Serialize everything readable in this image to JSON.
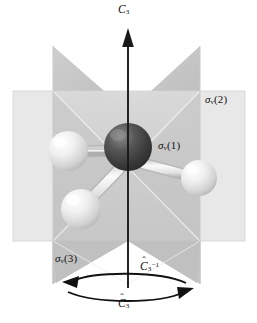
{
  "figure": {
    "name": "ammonia-c3v-symmetry-diagram",
    "caption_absent": true,
    "background_color": "#ffffff"
  },
  "labels": {
    "axis": {
      "symbol": "C",
      "subscript": "3",
      "text": "C3",
      "name": "c3-axis-label"
    },
    "mirror_planes": [
      {
        "id": "sv1",
        "symbol": "σ",
        "subscript": "v",
        "paren": "(1)",
        "text": "σv(1)"
      },
      {
        "id": "sv2",
        "symbol": "σ",
        "subscript": "v",
        "paren": "(2)",
        "text": "σv(2)"
      },
      {
        "id": "sv3",
        "symbol": "σ",
        "subscript": "v",
        "paren": "(3)",
        "text": "σv(3)"
      }
    ],
    "rotations": [
      {
        "id": "c3-inverse",
        "symbol": "C",
        "subscript": "3",
        "superscript": "−1",
        "hat": "ˆ",
        "text": "Ĉ₃⁻¹"
      },
      {
        "id": "c3-forward",
        "symbol": "C",
        "subscript": "3",
        "superscript": "",
        "hat": "ˆ",
        "text": "Ĉ₃"
      }
    ]
  },
  "colors": {
    "plane_light": "#e7e7e7",
    "plane_mid": "#cfcfcf",
    "plane_dark": "#bdbdbd",
    "plane_edge": "#f3f3f3",
    "axis_line": "#1a1a1a",
    "central_atom_dark": "#3b3b3b",
    "central_atom_light": "#6e6e6e",
    "outer_atom_light": "#f2f2f2",
    "outer_atom_mid": "#c9c9c9",
    "bond": "#ededed",
    "bond_shade": "#b9b9b9",
    "text": "#111111"
  },
  "geometry": {
    "axis_x": 128,
    "axis_top_y": 28,
    "axis_bottom_y": 288,
    "central_atom": {
      "cx": 128,
      "cy": 147,
      "r": 24
    },
    "outer_atoms": [
      {
        "id": "h-left",
        "cx": 68,
        "cy": 151,
        "r": 20
      },
      {
        "id": "h-right",
        "cx": 199,
        "cy": 178,
        "r": 18
      },
      {
        "id": "h-lower-left",
        "cx": 81,
        "cy": 209,
        "r": 20
      }
    ],
    "horizontal_plane": {
      "x": 13,
      "y": 91,
      "w": 232,
      "h": 150
    },
    "vertical_plane_left_x": 53,
    "vertical_plane_right_x": 200,
    "vertical_plane_top_y": 46,
    "vertical_plane_bottom_y": 284
  },
  "arrows": {
    "axis_arrow": {
      "name": "c3-axis-arrow",
      "direction": "up"
    },
    "rotation_arrow_left": {
      "name": "c3-inverse-arrow",
      "direction": "counterclockwise-left"
    },
    "rotation_arrow_right": {
      "name": "c3-forward-arrow",
      "direction": "clockwise-right"
    }
  }
}
